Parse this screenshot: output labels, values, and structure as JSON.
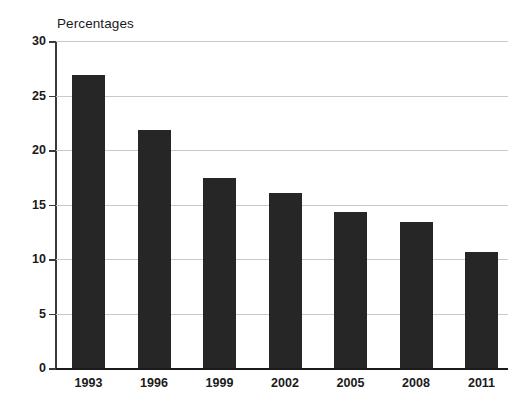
{
  "chart_data": {
    "type": "bar",
    "title": "Percentages",
    "subtitle": "",
    "xlabel": "",
    "ylabel": "",
    "categories": [
      "1993",
      "1996",
      "1999",
      "2002",
      "2005",
      "2008",
      "2011"
    ],
    "values": [
      26.9,
      21.8,
      17.4,
      16.1,
      14.3,
      13.4,
      10.6
    ],
    "series": [
      {
        "name": "Percentages",
        "values": [
          26.9,
          21.8,
          17.4,
          16.1,
          14.3,
          13.4,
          10.6
        ]
      }
    ],
    "ylim": [
      0,
      30
    ],
    "yticks": [
      0,
      5,
      10,
      15,
      20,
      25,
      30
    ],
    "ytick_labels": [
      "0",
      "5",
      "10",
      "15",
      "20",
      "25",
      "30"
    ],
    "grid": true,
    "grid_axis": "y",
    "legend": false,
    "legend_position": "none",
    "bar_color": "#262626",
    "gridline_color": "#c9c9c9",
    "axis_color": "#3a3a3a",
    "background_color": "#ffffff",
    "annotations": []
  }
}
